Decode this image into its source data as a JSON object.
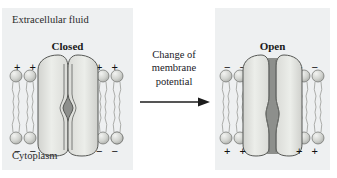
{
  "figure": {
    "topic": "voltage-gated-ion-channel",
    "cut_off_top_text": ""
  },
  "panels": [
    {
      "id": "closed",
      "state_label": "Closed",
      "top_region_label": "Extracellular fluid",
      "bottom_region_label": "Cytoplasm",
      "top_charges_left": "+ +",
      "top_charges_right": "+ +",
      "bottom_charges_left": "− −",
      "bottom_charges_right": "− −",
      "pore": "closed-pinched"
    },
    {
      "id": "open",
      "state_label": "Open",
      "top_region_label": "",
      "bottom_region_label": "",
      "top_charges_left": "− −",
      "top_charges_right": "− −",
      "bottom_charges_left": "+ +",
      "bottom_charges_right": "+ +",
      "pore": "open-wide"
    }
  ],
  "transition": {
    "line1": "Change of",
    "line2": "membrane",
    "line3": "potential",
    "arrow_direction": "right"
  },
  "colors": {
    "panel_background": "#eef0f1",
    "protein_light": "#e3e4e2",
    "protein_mid": "#c9cac6",
    "pore_dark": "#8d8f8c",
    "lipid_head": "#cfd1cd",
    "lipid_tail": "#b9bbb7",
    "outline": "#4a4a48",
    "text": "#1a1a1a"
  }
}
